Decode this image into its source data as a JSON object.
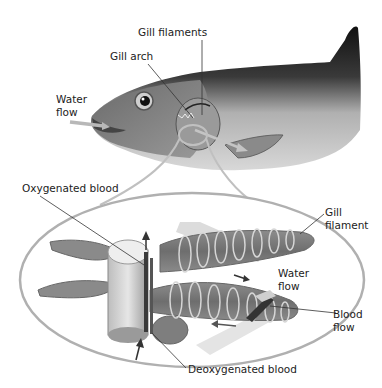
{
  "diagram": {
    "colors": {
      "fish_dark": "#1a1a1a",
      "fish_mid": "#8a8a8a",
      "fish_light": "#d8d8d8",
      "flow_arrow": "#b8b8b8",
      "outline": "#a8a8a8",
      "leader_line": "#333333",
      "text": "#222222"
    },
    "labels": {
      "gill_filaments": "Gill filaments",
      "gill_arch": "Gill arch",
      "water_flow_top_line1": "Water",
      "water_flow_top_line2": "flow",
      "oxygenated_blood": "Oxygenated blood",
      "gill_filament_line1": "Gill",
      "gill_filament_line2": "filament",
      "water_flow_detail_line1": "Water",
      "water_flow_detail_line2": "flow",
      "blood_flow_line1": "Blood",
      "blood_flow_line2": "flow",
      "deoxygenated_blood": "Deoxygenated blood"
    }
  }
}
